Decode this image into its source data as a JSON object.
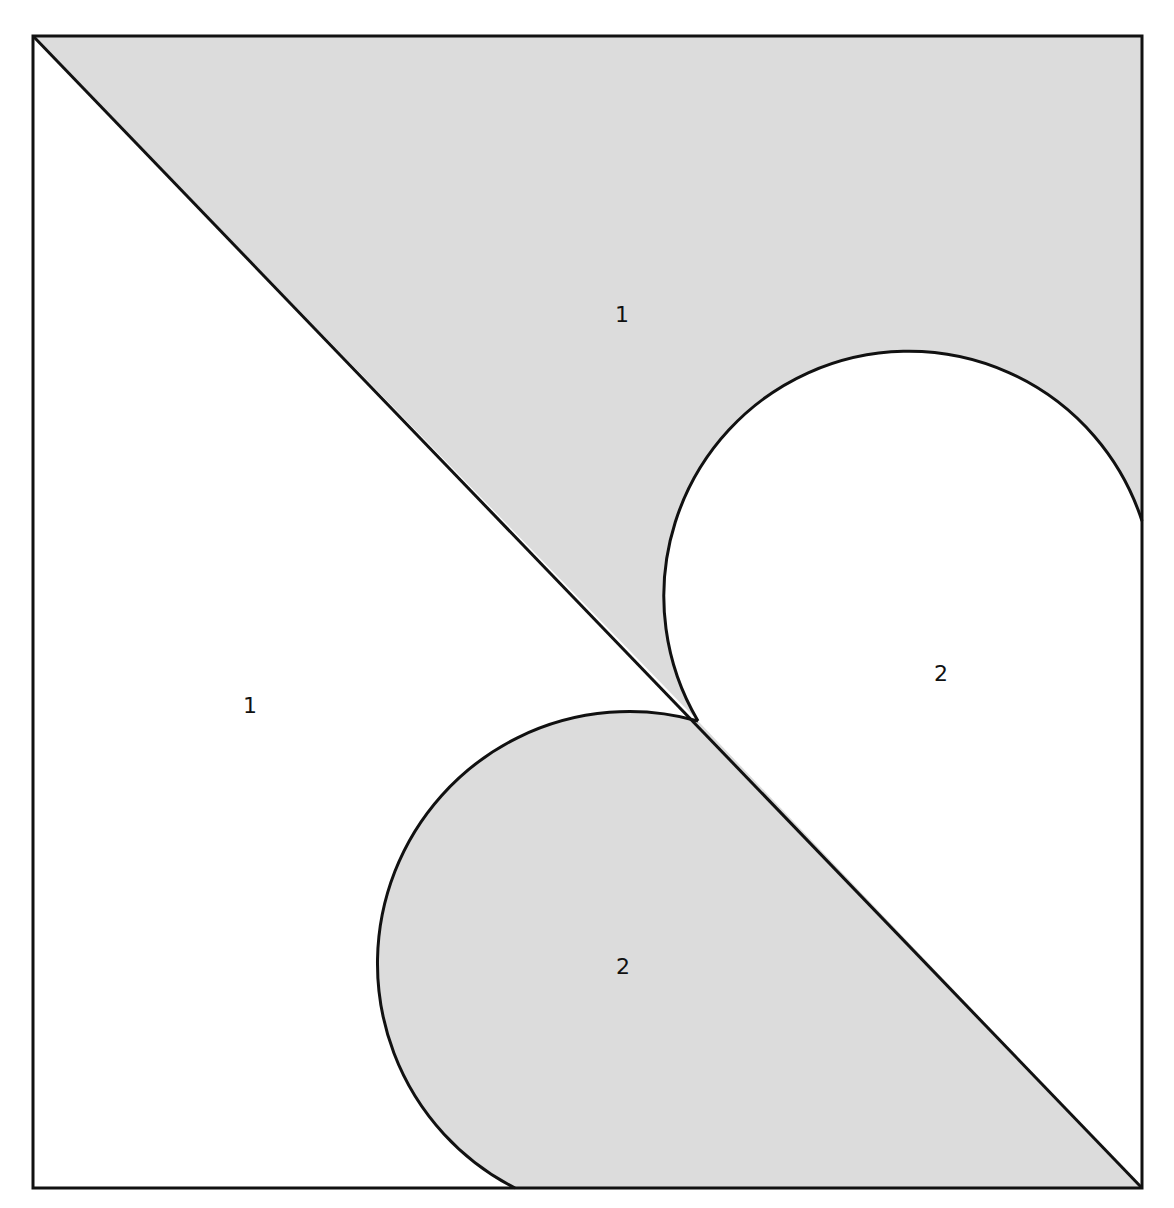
{
  "figure": {
    "width": 1174,
    "height": 1208,
    "square": {
      "x": 33,
      "y": 36,
      "w": 1109,
      "h": 1152
    },
    "colors": {
      "shaded": "#dcdcdc",
      "unshaded": "#ffffff",
      "stroke": "#111111"
    },
    "stroke_width": 3,
    "center_point": {
      "x": 698,
      "y": 721
    }
  },
  "regions": [
    {
      "id": "upper-triangle-shaded",
      "label": "1",
      "shaded": true,
      "label_x": 622,
      "label_y": 322
    },
    {
      "id": "left-triangle-unshaded",
      "label": "1",
      "shaded": false,
      "label_x": 250,
      "label_y": 713
    },
    {
      "id": "right-semicircle-unshaded",
      "label": "2",
      "shaded": false,
      "label_x": 940,
      "label_y": 681
    },
    {
      "id": "bottom-semicircle-shaded",
      "label": "2",
      "shaded": true,
      "label_x": 622,
      "label_y": 974
    }
  ],
  "labels": {
    "upper_shaded": "1",
    "left_unshaded": "1",
    "right_arc_region": "2",
    "bottom_arc_region": "2"
  }
}
